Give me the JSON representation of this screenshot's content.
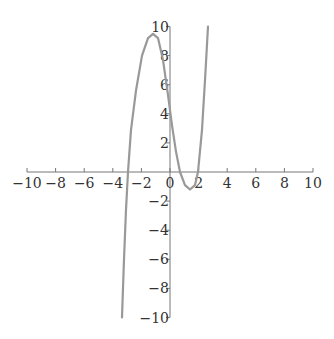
{
  "chart_data": {
    "type": "line",
    "title": "",
    "xlabel": "",
    "ylabel": "",
    "xlim": [
      -10,
      10
    ],
    "ylim": [
      -10,
      10
    ],
    "grid": false,
    "legend": null,
    "x_ticks": [
      -10,
      -8,
      -6,
      -4,
      -2,
      0,
      2,
      4,
      6,
      8,
      10
    ],
    "y_ticks": [
      -10,
      -8,
      -6,
      -4,
      -2,
      0,
      2,
      4,
      6,
      8,
      10
    ],
    "x_tick_labels": [
      "-10",
      "-8",
      "-6",
      "-4",
      "-2",
      "0",
      "2",
      "4",
      "6",
      "8",
      "10"
    ],
    "y_tick_labels": [
      "-10",
      "-8",
      "-6",
      "-4",
      "-2",
      "",
      "2",
      "4",
      "6",
      "8",
      "10"
    ],
    "series": [
      {
        "name": "cubic curve",
        "color": "#999999",
        "x": [
          -3.36,
          -3.22,
          -3.08,
          -2.94,
          -2.73,
          -2.38,
          -1.96,
          -1.54,
          -1.19,
          -0.84,
          -0.49,
          -0.14,
          0.14,
          0.42,
          0.7,
          1.05,
          1.4,
          1.75,
          1.96,
          2.24,
          2.45,
          2.66
        ],
        "values": [
          -10.0,
          -6.0,
          -2.6,
          0.0,
          2.9,
          5.6,
          8.0,
          9.2,
          9.5,
          9.2,
          7.7,
          5.3,
          3.2,
          1.4,
          0.0,
          -0.9,
          -1.2,
          -0.9,
          0.0,
          2.9,
          6.3,
          10.0
        ]
      }
    ]
  }
}
